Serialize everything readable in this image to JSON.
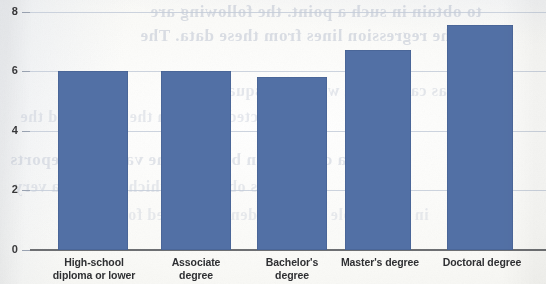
{
  "chart_data": {
    "type": "bar",
    "title": "",
    "subtitle": "",
    "xlabel": "",
    "ylabel": "",
    "categories": [
      "High-school\ndiploma or lower",
      "Associate\ndegree",
      "Bachelor's\ndegree",
      "Master's degree",
      "Doctoral degree"
    ],
    "values": [
      6.0,
      6.0,
      5.8,
      6.7,
      7.55
    ],
    "ylim": [
      0,
      8
    ],
    "yticks": [
      0,
      2,
      4,
      6,
      8
    ],
    "ytick_labels": [
      "0",
      "2",
      "4",
      "6",
      "8"
    ],
    "grid": true,
    "grid_axis": "y",
    "legend": false,
    "legend_position": "none",
    "bar_color": "#5270a5",
    "gridline_color": "#c3cbd8",
    "axis_color": "#6d6f72",
    "background_color": "#fbfbf9",
    "annotations": []
  },
  "scan_artifacts": {
    "description": "show-through text from reverse side of printed page",
    "ghost_lines": [
      "to obtain in such a point.  the following are",
      "and the regression lines from these data. The",
      "values was carried out with an R-squared. The",
      "the predicted values in the model and the",
      "a correlation between the variables reports",
      "estimates obtained, which indicate a very",
      "in the sample of respondents surveyed for"
    ]
  }
}
